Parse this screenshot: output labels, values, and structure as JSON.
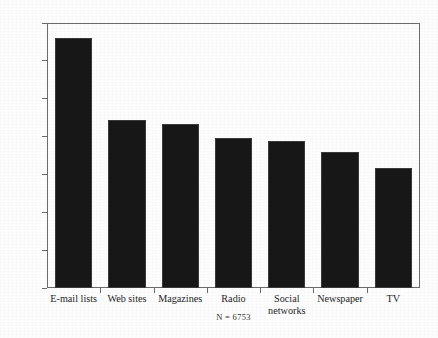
{
  "chart_data": {
    "type": "bar",
    "title": "",
    "subtitle": "",
    "xlabel": "",
    "ylabel": "Mean Denomination Diversity",
    "categories": [
      "E-mail lists",
      "Web sites",
      "Magazines",
      "Radio",
      "Social networks",
      "Newspaper",
      "TV"
    ],
    "values": [
      1.32,
      0.885,
      0.865,
      0.795,
      0.775,
      0.72,
      0.635
    ],
    "ylim": [
      0,
      1.4
    ],
    "ytick_labels": [
      "0",
      "0.2",
      "0.4",
      "0.6",
      "0.8",
      "1",
      "1.2",
      "1.4"
    ],
    "ytick_values": [
      0,
      0.2,
      0.4,
      0.6,
      0.8,
      1.0,
      1.2,
      1.4
    ],
    "grid": false,
    "legend": null,
    "annotation": "N = 6753",
    "bar_color": "#171717",
    "frame_color": "#6b6b6b",
    "background_color": "#fdfdfd"
  }
}
